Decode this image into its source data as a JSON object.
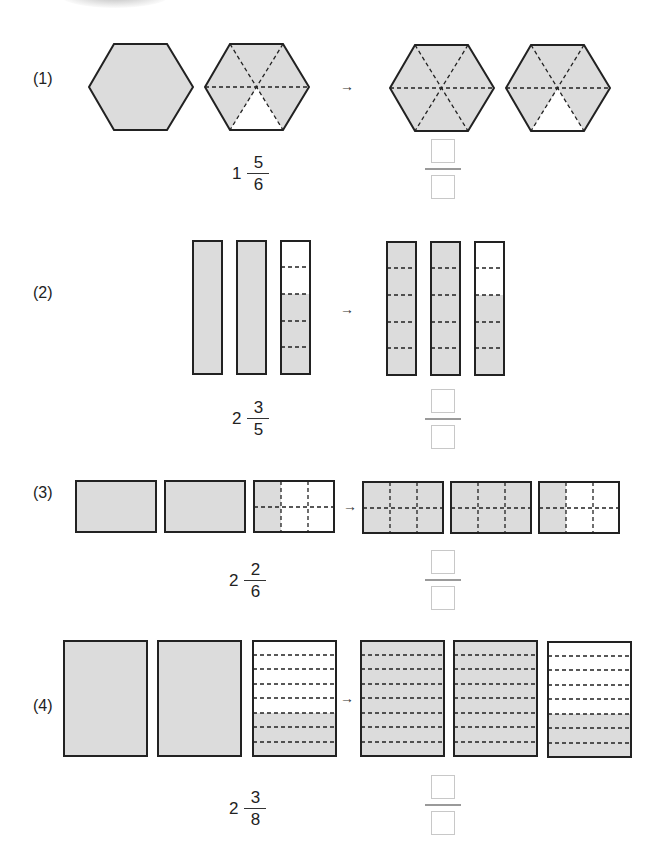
{
  "colors": {
    "shaded": "#dcdcdc",
    "unshaded": "#ffffff",
    "outline": "#222222",
    "answer_box": "#c8c8c8"
  },
  "problems": [
    {
      "label": "(1)",
      "shape": "hexagon",
      "parts_per_whole": 6,
      "given": {
        "whole": "1",
        "numerator": "5",
        "denominator": "6"
      },
      "arrow": "→",
      "answer": {
        "numerator": "",
        "denominator": ""
      }
    },
    {
      "label": "(2)",
      "shape": "vertical-bar",
      "parts_per_whole": 5,
      "given": {
        "whole": "2",
        "numerator": "3",
        "denominator": "5"
      },
      "arrow": "→",
      "answer": {
        "numerator": "",
        "denominator": ""
      }
    },
    {
      "label": "(3)",
      "shape": "rectangle-grid-3x2",
      "parts_per_whole": 6,
      "given": {
        "whole": "2",
        "numerator": "2",
        "denominator": "6"
      },
      "arrow": "→",
      "answer": {
        "numerator": "",
        "denominator": ""
      }
    },
    {
      "label": "(4)",
      "shape": "rectangle-rows",
      "parts_per_whole": 8,
      "given": {
        "whole": "2",
        "numerator": "3",
        "denominator": "8"
      },
      "arrow": "→",
      "answer": {
        "numerator": "",
        "denominator": ""
      }
    }
  ]
}
